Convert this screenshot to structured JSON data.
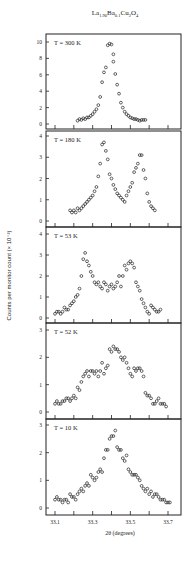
{
  "chart_data": [
    {
      "type": "scatter",
      "title": "La1.90Ba0.1Cu2O4",
      "panel_label": "T = 300 K",
      "xlabel": "2θ (degrees)",
      "ylabel": "Counts per monitor count (× 10^-3)",
      "xlim": [
        33.05,
        33.77
      ],
      "ylim": [
        -0.3,
        10.8
      ],
      "yticks": [
        0,
        2,
        4,
        6,
        8,
        10
      ],
      "x": [
        33.22,
        33.23,
        33.24,
        33.25,
        33.26,
        33.27,
        33.28,
        33.29,
        33.3,
        33.31,
        33.32,
        33.33,
        33.34,
        33.35,
        33.36,
        33.37,
        33.38,
        33.39,
        33.4,
        33.41,
        33.41,
        33.42,
        33.43,
        33.44,
        33.45,
        33.46,
        33.47,
        33.48,
        33.49,
        33.5,
        33.51,
        33.52,
        33.53,
        33.54,
        33.55,
        33.56,
        33.57,
        33.58
      ],
      "y": [
        0.4,
        0.6,
        0.5,
        0.7,
        0.6,
        0.8,
        0.8,
        1.0,
        1.2,
        1.5,
        1.8,
        2.3,
        3.3,
        5.1,
        6.3,
        6.9,
        9.6,
        9.8,
        9.7,
        8.5,
        7.6,
        6.1,
        4.8,
        3.7,
        2.6,
        2.0,
        1.5,
        1.2,
        1.0,
        0.8,
        0.7,
        0.6,
        0.6,
        0.5,
        0.4,
        0.5,
        0.5,
        0.5
      ]
    },
    {
      "type": "scatter",
      "panel_label": "T = 180 K",
      "xlim": [
        33.05,
        33.77
      ],
      "ylim": [
        -0.2,
        4.3
      ],
      "yticks": [
        0,
        1,
        2,
        3,
        4
      ],
      "x": [
        33.18,
        33.19,
        33.2,
        33.21,
        33.22,
        33.23,
        33.24,
        33.25,
        33.26,
        33.27,
        33.28,
        33.29,
        33.3,
        33.31,
        33.32,
        33.33,
        33.34,
        33.35,
        33.36,
        33.37,
        33.38,
        33.39,
        33.4,
        33.41,
        33.42,
        33.43,
        33.44,
        33.45,
        33.46,
        33.47,
        33.48,
        33.49,
        33.5,
        33.51,
        33.52,
        33.53,
        33.54,
        33.55,
        33.56,
        33.57,
        33.58,
        33.59,
        33.6,
        33.61,
        33.62,
        33.63
      ],
      "y": [
        0.5,
        0.4,
        0.5,
        0.4,
        0.6,
        0.5,
        0.6,
        0.7,
        0.8,
        0.9,
        1.0,
        1.1,
        1.2,
        1.4,
        1.6,
        2.1,
        2.7,
        3.6,
        3.7,
        3.3,
        2.9,
        2.2,
        2.0,
        1.7,
        1.5,
        1.3,
        1.2,
        1.1,
        1.0,
        0.9,
        1.2,
        1.4,
        1.6,
        1.8,
        2.3,
        2.5,
        2.7,
        3.1,
        3.1,
        2.4,
        2.0,
        1.3,
        0.9,
        0.7,
        0.6,
        0.5
      ]
    },
    {
      "type": "scatter",
      "panel_label": "T = 53 K",
      "xlim": [
        33.05,
        33.77
      ],
      "ylim": [
        -0.2,
        4.3
      ],
      "yticks": [
        0,
        1,
        2,
        3,
        4
      ],
      "x": [
        33.1,
        33.11,
        33.12,
        33.13,
        33.14,
        33.15,
        33.16,
        33.17,
        33.18,
        33.19,
        33.2,
        33.21,
        33.22,
        33.23,
        33.24,
        33.25,
        33.26,
        33.27,
        33.28,
        33.29,
        33.3,
        33.31,
        33.32,
        33.33,
        33.34,
        33.35,
        33.36,
        33.37,
        33.38,
        33.39,
        33.4,
        33.41,
        33.42,
        33.43,
        33.44,
        33.45,
        33.46,
        33.47,
        33.48,
        33.49,
        33.5,
        33.51,
        33.52,
        33.53,
        33.54,
        33.55,
        33.56,
        33.57,
        33.58,
        33.59,
        33.6,
        33.61,
        33.62,
        33.63,
        33.64,
        33.65,
        33.66
      ],
      "y": [
        0.2,
        0.3,
        0.3,
        0.2,
        0.3,
        0.5,
        0.4,
        0.4,
        0.6,
        0.7,
        0.8,
        1.0,
        1.1,
        1.4,
        2.0,
        2.8,
        3.1,
        2.7,
        2.5,
        2.2,
        2.0,
        1.7,
        1.6,
        1.7,
        1.5,
        1.4,
        1.7,
        1.6,
        1.3,
        1.5,
        1.6,
        1.4,
        1.5,
        1.7,
        2.0,
        1.5,
        2.0,
        2.5,
        2.3,
        2.6,
        2.7,
        2.6,
        2.4,
        1.7,
        1.5,
        1.3,
        0.9,
        0.7,
        0.5,
        0.3,
        0.2,
        0.6,
        0.5,
        0.4,
        0.3,
        0.3,
        0.4
      ]
    },
    {
      "type": "scatter",
      "panel_label": "T = 52 K",
      "xlim": [
        33.05,
        33.77
      ],
      "ylim": [
        -0.2,
        3.2
      ],
      "yticks": [
        0,
        1,
        2,
        3
      ],
      "x": [
        33.1,
        33.11,
        33.12,
        33.13,
        33.14,
        33.15,
        33.16,
        33.17,
        33.18,
        33.19,
        33.2,
        33.21,
        33.22,
        33.23,
        33.24,
        33.25,
        33.26,
        33.27,
        33.28,
        33.29,
        33.3,
        33.31,
        33.32,
        33.33,
        33.34,
        33.35,
        33.36,
        33.37,
        33.38,
        33.39,
        33.4,
        33.41,
        33.42,
        33.43,
        33.44,
        33.45,
        33.46,
        33.47,
        33.48,
        33.49,
        33.5,
        33.51,
        33.52,
        33.53,
        33.54,
        33.55,
        33.56,
        33.57,
        33.58,
        33.59,
        33.6,
        33.61,
        33.62,
        33.63,
        33.64,
        33.65,
        33.66,
        33.67,
        33.68,
        33.69
      ],
      "y": [
        0.3,
        0.4,
        0.3,
        0.3,
        0.4,
        0.4,
        0.5,
        0.5,
        0.4,
        0.5,
        0.6,
        0.5,
        0.9,
        0.8,
        1.1,
        1.3,
        1.4,
        1.5,
        1.3,
        1.5,
        1.5,
        1.4,
        1.5,
        1.3,
        1.5,
        1.8,
        1.4,
        1.6,
        1.7,
        2.3,
        2.2,
        2.4,
        2.3,
        2.3,
        2.2,
        2.0,
        1.9,
        2.0,
        1.8,
        1.6,
        1.4,
        1.3,
        1.6,
        1.5,
        1.6,
        1.6,
        1.5,
        1.3,
        0.7,
        0.6,
        0.6,
        0.5,
        0.3,
        0.3,
        0.4,
        0.5,
        0.3,
        0.3,
        0.3,
        0.2
      ]
    },
    {
      "type": "scatter",
      "panel_label": "T = 10 K",
      "xlim": [
        33.05,
        33.77
      ],
      "ylim": [
        -0.2,
        3.2
      ],
      "yticks": [
        0,
        1,
        2,
        3
      ],
      "xticks": [
        33.1,
        33.3,
        33.5,
        33.7
      ],
      "x": [
        33.1,
        33.11,
        33.12,
        33.13,
        33.14,
        33.15,
        33.16,
        33.17,
        33.18,
        33.19,
        33.2,
        33.21,
        33.22,
        33.23,
        33.24,
        33.25,
        33.26,
        33.27,
        33.28,
        33.29,
        33.3,
        33.31,
        33.32,
        33.33,
        33.34,
        33.35,
        33.36,
        33.37,
        33.38,
        33.39,
        33.4,
        33.41,
        33.42,
        33.43,
        33.44,
        33.45,
        33.46,
        33.47,
        33.48,
        33.49,
        33.5,
        33.51,
        33.52,
        33.53,
        33.54,
        33.55,
        33.56,
        33.57,
        33.58,
        33.59,
        33.6,
        33.61,
        33.62,
        33.63,
        33.64,
        33.65,
        33.66,
        33.67,
        33.68,
        33.69,
        33.7,
        33.71
      ],
      "y": [
        0.3,
        0.4,
        0.3,
        0.3,
        0.2,
        0.3,
        0.3,
        0.2,
        0.5,
        0.4,
        0.4,
        0.3,
        0.5,
        0.6,
        0.7,
        0.6,
        0.8,
        0.9,
        0.8,
        1.2,
        1.1,
        1.0,
        1.1,
        1.3,
        1.4,
        1.3,
        1.8,
        2.1,
        2.1,
        2.5,
        2.6,
        2.6,
        2.8,
        2.2,
        2.1,
        2.1,
        1.8,
        1.7,
        1.9,
        1.4,
        1.3,
        1.2,
        1.2,
        1.2,
        1.1,
        1.0,
        0.8,
        0.7,
        0.6,
        0.7,
        0.5,
        0.6,
        0.4,
        0.5,
        0.5,
        0.4,
        0.3,
        0.3,
        0.3,
        0.2,
        0.2,
        0.2
      ]
    }
  ],
  "figure": {
    "title_main": "La",
    "title_sub1": "1.90",
    "title_mid": "Ba",
    "title_sub2": "0.1",
    "title_mid2": "Cu",
    "title_sub3": "2",
    "title_end": "O",
    "title_sub4": "4",
    "ylabel": "Counts per monitor count (× 10⁻³)",
    "xlabel": "2θ (degrees)",
    "frame_color": "#222222",
    "marker_color": "#222222"
  },
  "layout": {
    "frame_left": 46,
    "frame_right": 181,
    "panels": [
      {
        "top": 34,
        "bottom": 129,
        "y_top_val": 10,
        "y_top_px": 42,
        "y0_px": 124
      },
      {
        "top": 131,
        "bottom": 227,
        "y_top_val": 4,
        "y_top_px": 136,
        "y0_px": 221
      },
      {
        "top": 227,
        "bottom": 323,
        "y_top_val": 4,
        "y_top_px": 234,
        "y0_px": 318
      },
      {
        "top": 323,
        "bottom": 419,
        "y_top_val": 3,
        "y_top_px": 330,
        "y0_px": 412
      },
      {
        "top": 419,
        "bottom": 515,
        "y_top_val": 3,
        "y_top_px": 425,
        "y0_px": 508
      }
    ]
  }
}
